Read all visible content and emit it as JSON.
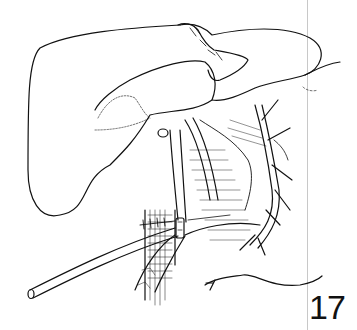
{
  "figure": {
    "number": "17",
    "colors": {
      "ink": "#111111",
      "background": "#ffffff",
      "rule": "#c8c8c8"
    }
  }
}
